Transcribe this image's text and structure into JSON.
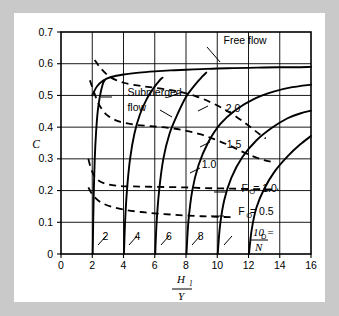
{
  "figure": {
    "background_color": "#c9c9c9",
    "panel_color": "#ffffff",
    "ink_color": "#000000"
  },
  "chart_data": {
    "type": "line",
    "title": "",
    "xlabel": "H1/Y",
    "xlabel_numerator": "H",
    "xlabel_numerator_sub": "1",
    "xlabel_denominator": "Y",
    "ylabel": "C",
    "xlim": [
      0,
      16
    ],
    "ylim": [
      0,
      0.7
    ],
    "xticks": [
      "0",
      "2",
      "4",
      "6",
      "8",
      "10",
      "12",
      "14",
      "16"
    ],
    "xtick_values": [
      0,
      2,
      4,
      6,
      8,
      10,
      12,
      14,
      16
    ],
    "yticks": [
      "0",
      "0.1",
      "0.2",
      "0.3",
      "0.4",
      "0.5",
      "0.6",
      "0.7"
    ],
    "ytick_values": [
      0,
      0.1,
      0.2,
      0.3,
      0.4,
      0.5,
      0.6,
      0.7
    ],
    "grid": true,
    "legend_position": "inline-labels",
    "annotations": [
      {
        "text": "Free flow",
        "x": 10.4,
        "y": 0.663
      },
      {
        "text": "Submerged",
        "x": 4.25,
        "y": 0.497
      },
      {
        "text": "flow",
        "x": 4.25,
        "y": 0.452
      },
      {
        "text": "2.0",
        "x": 10.55,
        "y": 0.447
      },
      {
        "text": "1.5",
        "x": 10.6,
        "y": 0.333
      },
      {
        "text": "1.0",
        "x": 9.0,
        "y": 0.27
      },
      {
        "text": "F",
        "x": 11.55,
        "y": 0.197
      },
      {
        "text": "O",
        "x": 12.05,
        "y": 0.188
      },
      {
        "text": "= 1.0",
        "x": 12.3,
        "y": 0.197
      },
      {
        "text": "F",
        "x": 11.35,
        "y": 0.122
      },
      {
        "text": "O",
        "x": 11.85,
        "y": 0.113
      },
      {
        "text": "= 0.5",
        "x": 12.1,
        "y": 0.122
      },
      {
        "text": "2",
        "x": 2.65,
        "y": 0.043
      },
      {
        "text": "4",
        "x": 4.7,
        "y": 0.043
      },
      {
        "text": "6",
        "x": 6.72,
        "y": 0.043
      },
      {
        "text": "8",
        "x": 8.75,
        "y": 0.043
      },
      {
        "text": "10 =",
        "x": 10.75,
        "y": 0.043
      },
      {
        "text": "D",
        "x": 12.6,
        "y": 0.058
      },
      {
        "text": "N",
        "x": 13.1,
        "y": 0.05
      },
      {
        "text": "Y",
        "x": 12.75,
        "y": 0.012
      }
    ],
    "series": [
      {
        "name": "Free flow",
        "style": "solid",
        "points": [
          [
            2.0,
            0.5
          ],
          [
            2.3,
            0.528
          ],
          [
            2.7,
            0.547
          ],
          [
            3.2,
            0.558
          ],
          [
            4.0,
            0.566
          ],
          [
            5.0,
            0.572
          ],
          [
            6.0,
            0.576
          ],
          [
            7.0,
            0.579
          ],
          [
            8.0,
            0.581
          ],
          [
            9.0,
            0.583
          ],
          [
            10.0,
            0.585
          ],
          [
            11.0,
            0.586
          ],
          [
            12.0,
            0.587
          ],
          [
            13.0,
            0.588
          ],
          [
            14.0,
            0.589
          ],
          [
            15.0,
            0.589
          ],
          [
            16.0,
            0.59
          ]
        ]
      },
      {
        "name": "DN/Y = 2",
        "style": "solid",
        "points": [
          [
            2.03,
            0.0
          ],
          [
            2.06,
            0.1
          ],
          [
            2.1,
            0.2
          ],
          [
            2.16,
            0.3
          ],
          [
            2.24,
            0.38
          ],
          [
            2.35,
            0.45
          ],
          [
            2.5,
            0.5
          ],
          [
            2.68,
            0.537
          ],
          [
            2.8,
            0.548
          ]
        ]
      },
      {
        "name": "DN/Y = 4",
        "style": "solid",
        "points": [
          [
            4.03,
            0.0
          ],
          [
            4.1,
            0.1
          ],
          [
            4.22,
            0.2
          ],
          [
            4.42,
            0.3
          ],
          [
            4.7,
            0.38
          ],
          [
            5.05,
            0.44
          ],
          [
            5.5,
            0.49
          ],
          [
            5.95,
            0.525
          ],
          [
            6.3,
            0.547
          ],
          [
            6.5,
            0.556
          ]
        ]
      },
      {
        "name": "DN/Y = 6",
        "style": "solid",
        "points": [
          [
            6.03,
            0.0
          ],
          [
            6.12,
            0.1
          ],
          [
            6.28,
            0.2
          ],
          [
            6.55,
            0.3
          ],
          [
            6.95,
            0.38
          ],
          [
            7.45,
            0.44
          ],
          [
            8.0,
            0.495
          ],
          [
            8.6,
            0.535
          ],
          [
            9.05,
            0.56
          ],
          [
            9.3,
            0.572
          ]
        ]
      },
      {
        "name": "DN/Y = 8",
        "style": "solid",
        "points": [
          [
            8.03,
            0.0
          ],
          [
            8.15,
            0.1
          ],
          [
            8.4,
            0.2
          ],
          [
            8.8,
            0.28
          ],
          [
            9.4,
            0.35
          ],
          [
            10.2,
            0.41
          ],
          [
            11.2,
            0.455
          ],
          [
            12.4,
            0.49
          ],
          [
            13.6,
            0.512
          ],
          [
            14.8,
            0.526
          ],
          [
            16.0,
            0.534
          ]
        ]
      },
      {
        "name": "DN/Y = 10",
        "style": "solid",
        "points": [
          [
            10.03,
            0.0
          ],
          [
            10.18,
            0.09
          ],
          [
            10.45,
            0.17
          ],
          [
            10.9,
            0.24
          ],
          [
            11.6,
            0.305
          ],
          [
            12.5,
            0.358
          ],
          [
            13.5,
            0.398
          ],
          [
            14.5,
            0.428
          ],
          [
            15.3,
            0.443
          ],
          [
            16.0,
            0.452
          ]
        ]
      },
      {
        "name": "DN/Y = 12",
        "style": "solid",
        "points": [
          [
            12.03,
            0.0
          ],
          [
            12.2,
            0.075
          ],
          [
            12.5,
            0.145
          ],
          [
            13.0,
            0.205
          ],
          [
            13.7,
            0.262
          ],
          [
            14.5,
            0.308
          ],
          [
            15.3,
            0.345
          ],
          [
            16.0,
            0.372
          ]
        ]
      },
      {
        "name": "FO = 2.0",
        "style": "dashed",
        "points": [
          [
            2.15,
            0.612
          ],
          [
            2.55,
            0.585
          ],
          [
            3.15,
            0.558
          ],
          [
            4.0,
            0.54
          ],
          [
            5.1,
            0.53
          ],
          [
            6.3,
            0.522
          ],
          [
            7.5,
            0.512
          ],
          [
            8.6,
            0.498
          ],
          [
            9.6,
            0.478
          ],
          [
            10.5,
            0.455
          ],
          [
            11.3,
            0.43
          ],
          [
            12.0,
            0.405
          ],
          [
            12.6,
            0.382
          ],
          [
            13.1,
            0.364
          ]
        ]
      },
      {
        "name": "FO = 1.5",
        "style": "dashed",
        "points": [
          [
            1.85,
            0.548
          ],
          [
            2.1,
            0.512
          ],
          [
            2.45,
            0.47
          ],
          [
            2.95,
            0.438
          ],
          [
            3.7,
            0.418
          ],
          [
            4.7,
            0.408
          ],
          [
            5.75,
            0.403
          ],
          [
            6.85,
            0.398
          ],
          [
            7.9,
            0.39
          ],
          [
            8.9,
            0.378
          ],
          [
            9.8,
            0.362
          ],
          [
            10.7,
            0.344
          ],
          [
            11.5,
            0.325
          ],
          [
            12.3,
            0.308
          ],
          [
            13.0,
            0.296
          ],
          [
            13.7,
            0.288
          ]
        ]
      },
      {
        "name": "FO = 1.0",
        "style": "dashed",
        "points": [
          [
            1.75,
            0.3
          ],
          [
            1.95,
            0.265
          ],
          [
            2.25,
            0.238
          ],
          [
            2.8,
            0.222
          ],
          [
            3.6,
            0.215
          ],
          [
            4.6,
            0.213
          ],
          [
            5.7,
            0.212
          ],
          [
            6.85,
            0.211
          ],
          [
            7.95,
            0.21
          ],
          [
            9.0,
            0.208
          ],
          [
            10.0,
            0.207
          ],
          [
            11.0,
            0.206
          ],
          [
            12.0,
            0.205
          ],
          [
            13.0,
            0.204
          ],
          [
            13.9,
            0.204
          ]
        ]
      },
      {
        "name": "FO = 0.5",
        "style": "dashed",
        "points": [
          [
            1.75,
            0.21
          ],
          [
            2.05,
            0.185
          ],
          [
            2.55,
            0.163
          ],
          [
            3.3,
            0.148
          ],
          [
            4.25,
            0.138
          ],
          [
            5.4,
            0.131
          ],
          [
            6.6,
            0.126
          ],
          [
            7.8,
            0.122
          ],
          [
            9.0,
            0.119
          ],
          [
            10.2,
            0.117
          ],
          [
            11.0,
            0.116
          ]
        ]
      }
    ]
  }
}
